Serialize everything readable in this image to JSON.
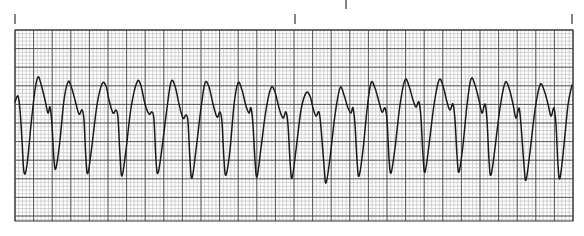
{
  "chart_data": {
    "type": "line",
    "title": "",
    "subtitle": "",
    "xlabel": "",
    "ylabel": "",
    "grid": true,
    "legend": null,
    "paper": {
      "x": 15,
      "y": 30,
      "width": 558,
      "height": 191,
      "major_spacing_px": 18.6,
      "minor_spacing_px": 3.72,
      "minor_color": "#b8b8b8",
      "major_color": "#4a4a4a",
      "trace_color": "#1a1a1a"
    },
    "time_markers_x": [
      15,
      295,
      572
    ],
    "top_marker_x": 346,
    "series": [
      {
        "name": "ECG trace",
        "points": [
          [
            15,
            102
          ],
          [
            18,
            96
          ],
          [
            20,
            110
          ],
          [
            22,
            140
          ],
          [
            24,
            172
          ],
          [
            27,
            165
          ],
          [
            31,
            125
          ],
          [
            35,
            90
          ],
          [
            38,
            77
          ],
          [
            41,
            84
          ],
          [
            45,
            100
          ],
          [
            48,
            113
          ],
          [
            50,
            107
          ],
          [
            52,
            125
          ],
          [
            54,
            160
          ],
          [
            56,
            168
          ],
          [
            60,
            140
          ],
          [
            64,
            100
          ],
          [
            68,
            82
          ],
          [
            71,
            86
          ],
          [
            75,
            100
          ],
          [
            79,
            114
          ],
          [
            82,
            110
          ],
          [
            84,
            120
          ],
          [
            86,
            160
          ],
          [
            88,
            173
          ],
          [
            92,
            145
          ],
          [
            97,
            105
          ],
          [
            102,
            84
          ],
          [
            106,
            86
          ],
          [
            109,
            100
          ],
          [
            113,
            113
          ],
          [
            116,
            110
          ],
          [
            118,
            118
          ],
          [
            120,
            155
          ],
          [
            122,
            176
          ],
          [
            126,
            150
          ],
          [
            131,
            108
          ],
          [
            137,
            82
          ],
          [
            141,
            86
          ],
          [
            145,
            104
          ],
          [
            149,
            114
          ],
          [
            152,
            112
          ],
          [
            154,
            120
          ],
          [
            156,
            160
          ],
          [
            158,
            173
          ],
          [
            162,
            148
          ],
          [
            167,
            108
          ],
          [
            171,
            82
          ],
          [
            175,
            86
          ],
          [
            179,
            104
          ],
          [
            183,
            118
          ],
          [
            186,
            115
          ],
          [
            188,
            122
          ],
          [
            190,
            160
          ],
          [
            192,
            178
          ],
          [
            196,
            150
          ],
          [
            201,
            108
          ],
          [
            205,
            83
          ],
          [
            209,
            87
          ],
          [
            213,
            104
          ],
          [
            217,
            117
          ],
          [
            220,
            112
          ],
          [
            222,
            122
          ],
          [
            224,
            160
          ],
          [
            226,
            175
          ],
          [
            230,
            150
          ],
          [
            234,
            105
          ],
          [
            238,
            83
          ],
          [
            242,
            90
          ],
          [
            246,
            106
          ],
          [
            249,
            113
          ],
          [
            251,
            108
          ],
          [
            253,
            125
          ],
          [
            255,
            160
          ],
          [
            257,
            177
          ],
          [
            261,
            148
          ],
          [
            266,
            110
          ],
          [
            271,
            88
          ],
          [
            275,
            92
          ],
          [
            279,
            108
          ],
          [
            283,
            118
          ],
          [
            286,
            112
          ],
          [
            288,
            125
          ],
          [
            290,
            160
          ],
          [
            292,
            178
          ],
          [
            296,
            150
          ],
          [
            301,
            110
          ],
          [
            306,
            93
          ],
          [
            310,
            96
          ],
          [
            313,
            108
          ],
          [
            316,
            116
          ],
          [
            319,
            112
          ],
          [
            321,
            128
          ],
          [
            324,
            165
          ],
          [
            326,
            183
          ],
          [
            330,
            158
          ],
          [
            335,
            115
          ],
          [
            340,
            88
          ],
          [
            344,
            95
          ],
          [
            348,
            108
          ],
          [
            351,
            113
          ],
          [
            353,
            108
          ],
          [
            355,
            125
          ],
          [
            357,
            160
          ],
          [
            359,
            176
          ],
          [
            363,
            150
          ],
          [
            367,
            110
          ],
          [
            371,
            83
          ],
          [
            375,
            88
          ],
          [
            379,
            102
          ],
          [
            382,
            112
          ],
          [
            385,
            108
          ],
          [
            387,
            120
          ],
          [
            389,
            158
          ],
          [
            391,
            173
          ],
          [
            395,
            148
          ],
          [
            400,
            105
          ],
          [
            405,
            80
          ],
          [
            409,
            86
          ],
          [
            413,
            100
          ],
          [
            416,
            107
          ],
          [
            419,
            102
          ],
          [
            421,
            118
          ],
          [
            423,
            155
          ],
          [
            425,
            172
          ],
          [
            429,
            145
          ],
          [
            434,
            105
          ],
          [
            439,
            80
          ],
          [
            443,
            86
          ],
          [
            447,
            102
          ],
          [
            450,
            110
          ],
          [
            453,
            104
          ],
          [
            455,
            120
          ],
          [
            457,
            155
          ],
          [
            459,
            172
          ],
          [
            463,
            145
          ],
          [
            467,
            105
          ],
          [
            471,
            79
          ],
          [
            475,
            85
          ],
          [
            479,
            100
          ],
          [
            482,
            113
          ],
          [
            485,
            104
          ],
          [
            487,
            120
          ],
          [
            489,
            160
          ],
          [
            491,
            175
          ],
          [
            495,
            148
          ],
          [
            500,
            108
          ],
          [
            505,
            83
          ],
          [
            509,
            88
          ],
          [
            513,
            104
          ],
          [
            516,
            118
          ],
          [
            519,
            108
          ],
          [
            521,
            125
          ],
          [
            524,
            165
          ],
          [
            526,
            180
          ],
          [
            530,
            152
          ],
          [
            535,
            110
          ],
          [
            540,
            85
          ],
          [
            544,
            90
          ],
          [
            548,
            104
          ],
          [
            551,
            116
          ],
          [
            554,
            108
          ],
          [
            556,
            125
          ],
          [
            558,
            165
          ],
          [
            560,
            178
          ],
          [
            564,
            145
          ],
          [
            568,
            105
          ],
          [
            572,
            85
          ]
        ]
      }
    ],
    "peaks": [
      {
        "x": 38,
        "y": 77
      },
      {
        "x": 68,
        "y": 82
      },
      {
        "x": 102,
        "y": 84
      },
      {
        "x": 137,
        "y": 82
      },
      {
        "x": 171,
        "y": 82
      },
      {
        "x": 205,
        "y": 83
      },
      {
        "x": 238,
        "y": 83
      },
      {
        "x": 271,
        "y": 88
      },
      {
        "x": 306,
        "y": 93
      },
      {
        "x": 340,
        "y": 88
      },
      {
        "x": 371,
        "y": 83
      },
      {
        "x": 405,
        "y": 80
      },
      {
        "x": 439,
        "y": 80
      },
      {
        "x": 471,
        "y": 79
      },
      {
        "x": 505,
        "y": 83
      },
      {
        "x": 540,
        "y": 85
      },
      {
        "x": 572,
        "y": 85
      }
    ],
    "troughs": [
      {
        "x": 24,
        "y": 172
      },
      {
        "x": 56,
        "y": 168
      },
      {
        "x": 88,
        "y": 173
      },
      {
        "x": 122,
        "y": 176
      },
      {
        "x": 158,
        "y": 173
      },
      {
        "x": 192,
        "y": 178
      },
      {
        "x": 226,
        "y": 175
      },
      {
        "x": 257,
        "y": 177
      },
      {
        "x": 292,
        "y": 178
      },
      {
        "x": 326,
        "y": 183
      },
      {
        "x": 359,
        "y": 176
      },
      {
        "x": 391,
        "y": 173
      },
      {
        "x": 425,
        "y": 172
      },
      {
        "x": 459,
        "y": 172
      },
      {
        "x": 491,
        "y": 175
      },
      {
        "x": 526,
        "y": 180
      },
      {
        "x": 560,
        "y": 178
      }
    ],
    "complex_count": 17
  }
}
